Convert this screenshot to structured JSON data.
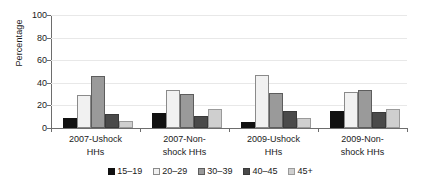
{
  "chart_data": {
    "type": "bar",
    "title": "",
    "subtitle": "",
    "xlabel": "",
    "ylabel": "Percentage",
    "ylim": [
      0,
      100
    ],
    "yticks": [
      0,
      20,
      40,
      60,
      80,
      100
    ],
    "ytick_labels": [
      "0",
      "20",
      "40",
      "60",
      "80",
      "100"
    ],
    "grid": true,
    "grid_axis": "y",
    "legend_position": "bottom",
    "categories": [
      "2007-Ushock HHs",
      "2007-Non-shock HHs",
      "2009-Ushock HHs",
      "2009-Non-shock HHs"
    ],
    "category_lines": [
      [
        "2007-Ushock",
        "HHs"
      ],
      [
        "2007-Non-",
        "shock HHs"
      ],
      [
        "2009-Ushock",
        "HHs"
      ],
      [
        "2009-Non-",
        "shock HHs"
      ]
    ],
    "series": [
      {
        "name": "15–19",
        "color": "#111111",
        "values": [
          9,
          13,
          5,
          15
        ]
      },
      {
        "name": "20–29",
        "color": "#f1f1f1",
        "values": [
          29,
          34,
          47,
          32
        ]
      },
      {
        "name": "30–39",
        "color": "#9a9a9a",
        "values": [
          46,
          30,
          31,
          34
        ]
      },
      {
        "name": "40–45",
        "color": "#4a4a4a",
        "values": [
          12,
          11,
          15,
          14
        ]
      },
      {
        "name": "45+",
        "color": "#cfcfcf",
        "values": [
          6,
          17,
          9,
          17
        ]
      }
    ]
  },
  "axis": {
    "y_title": "Percentage"
  }
}
